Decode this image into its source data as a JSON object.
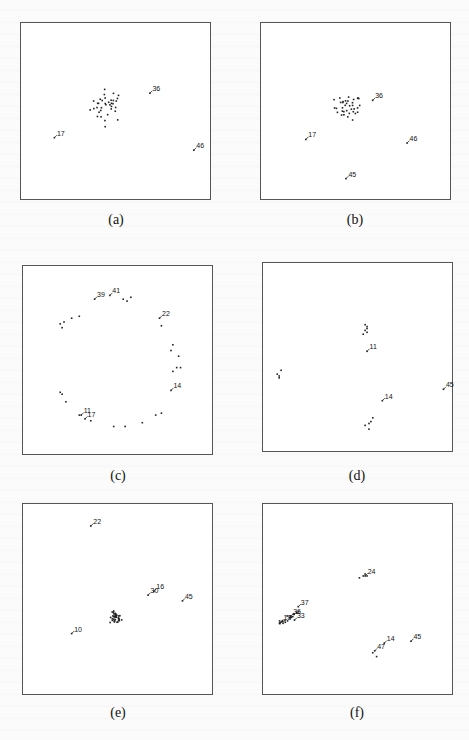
{
  "chart_data": [
    {
      "type": "scatter",
      "caption": "(a)",
      "title": "",
      "xlabel": "",
      "ylabel": "",
      "xlim": [
        0,
        1
      ],
      "ylim": [
        0,
        1
      ],
      "grid": false,
      "cluster": {
        "cx": 0.46,
        "cy": 0.53,
        "spread": 0.045,
        "n": 36
      },
      "labeled_points": [
        {
          "label": "36",
          "x": 0.68,
          "y": 0.6
        },
        {
          "label": "17",
          "x": 0.18,
          "y": 0.35
        },
        {
          "label": "46",
          "x": 0.91,
          "y": 0.28
        }
      ]
    },
    {
      "type": "scatter",
      "caption": "(b)",
      "title": "",
      "xlabel": "",
      "ylabel": "",
      "xlim": [
        0,
        1
      ],
      "ylim": [
        0,
        1
      ],
      "grid": false,
      "cluster": {
        "cx": 0.46,
        "cy": 0.52,
        "spread": 0.035,
        "n": 36
      },
      "labeled_points": [
        {
          "label": "36",
          "x": 0.59,
          "y": 0.56
        },
        {
          "label": "17",
          "x": 0.24,
          "y": 0.34
        },
        {
          "label": "46",
          "x": 0.77,
          "y": 0.32
        },
        {
          "label": "45",
          "x": 0.45,
          "y": 0.12
        }
      ]
    },
    {
      "type": "scatter",
      "caption": "(c)",
      "title": "",
      "xlabel": "",
      "ylabel": "",
      "xlim": [
        0,
        1
      ],
      "ylim": [
        0,
        1
      ],
      "grid": false,
      "unlabeled_points": [
        [
          0.53,
          0.82
        ],
        [
          0.55,
          0.81
        ],
        [
          0.57,
          0.83
        ],
        [
          0.3,
          0.73
        ],
        [
          0.26,
          0.72
        ],
        [
          0.22,
          0.7
        ],
        [
          0.2,
          0.69
        ],
        [
          0.21,
          0.67
        ],
        [
          0.73,
          0.68
        ],
        [
          0.79,
          0.58
        ],
        [
          0.78,
          0.55
        ],
        [
          0.82,
          0.52
        ],
        [
          0.81,
          0.46
        ],
        [
          0.83,
          0.46
        ],
        [
          0.79,
          0.44
        ],
        [
          0.21,
          0.32
        ],
        [
          0.23,
          0.28
        ],
        [
          0.3,
          0.21
        ],
        [
          0.36,
          0.18
        ],
        [
          0.48,
          0.15
        ],
        [
          0.54,
          0.15
        ],
        [
          0.63,
          0.17
        ],
        [
          0.73,
          0.22
        ],
        [
          0.7,
          0.21
        ],
        [
          0.2,
          0.33
        ]
      ],
      "labeled_points": [
        {
          "label": "39",
          "x": 0.38,
          "y": 0.82
        },
        {
          "label": "41",
          "x": 0.46,
          "y": 0.84
        },
        {
          "label": "22",
          "x": 0.72,
          "y": 0.72
        },
        {
          "label": "14",
          "x": 0.78,
          "y": 0.34
        },
        {
          "label": "11",
          "x": 0.31,
          "y": 0.21
        },
        {
          "label": "17",
          "x": 0.33,
          "y": 0.19
        }
      ]
    },
    {
      "type": "scatter",
      "caption": "(d)",
      "title": "",
      "xlabel": "",
      "ylabel": "",
      "xlim": [
        0,
        1
      ],
      "ylim": [
        0,
        1
      ],
      "grid": false,
      "unlabeled_points": [
        [
          0.54,
          0.64
        ],
        [
          0.55,
          0.65
        ],
        [
          0.54,
          0.67
        ],
        [
          0.55,
          0.66
        ],
        [
          0.53,
          0.62
        ],
        [
          0.55,
          0.63
        ],
        [
          0.08,
          0.41
        ],
        [
          0.09,
          0.39
        ],
        [
          0.1,
          0.43
        ],
        [
          0.09,
          0.4
        ],
        [
          0.56,
          0.15
        ],
        [
          0.57,
          0.16
        ],
        [
          0.54,
          0.14
        ],
        [
          0.56,
          0.12
        ],
        [
          0.58,
          0.18
        ]
      ],
      "labeled_points": [
        {
          "label": "11",
          "x": 0.55,
          "y": 0.53
        },
        {
          "label": "45",
          "x": 0.95,
          "y": 0.33
        },
        {
          "label": "14",
          "x": 0.63,
          "y": 0.27
        }
      ]
    },
    {
      "type": "scatter",
      "caption": "(e)",
      "title": "",
      "xlabel": "",
      "ylabel": "",
      "xlim": [
        0,
        1
      ],
      "ylim": [
        0,
        1
      ],
      "grid": false,
      "cluster": {
        "cx": 0.49,
        "cy": 0.4,
        "spread": 0.015,
        "n": 36
      },
      "labeled_points": [
        {
          "label": "22",
          "x": 0.36,
          "y": 0.88
        },
        {
          "label": "16",
          "x": 0.69,
          "y": 0.54
        },
        {
          "label": "30",
          "x": 0.66,
          "y": 0.52
        },
        {
          "label": "45",
          "x": 0.84,
          "y": 0.49
        },
        {
          "label": "10",
          "x": 0.26,
          "y": 0.32
        }
      ]
    },
    {
      "type": "scatter",
      "caption": "(f)",
      "title": "",
      "xlabel": "",
      "ylabel": "",
      "xlim": [
        0,
        1
      ],
      "ylim": [
        0,
        1
      ],
      "grid": false,
      "elongated_cluster": {
        "x0": 0.09,
        "y0": 0.37,
        "x1": 0.19,
        "y1": 0.43,
        "n": 22
      },
      "unlabeled_points": [
        [
          0.51,
          0.61
        ],
        [
          0.53,
          0.62
        ],
        [
          0.54,
          0.63
        ],
        [
          0.55,
          0.62
        ],
        [
          0.58,
          0.22
        ],
        [
          0.6,
          0.2
        ]
      ],
      "labeled_points": [
        {
          "label": "24",
          "x": 0.54,
          "y": 0.62
        },
        {
          "label": "37",
          "x": 0.19,
          "y": 0.46
        },
        {
          "label": "18",
          "x": 0.1,
          "y": 0.38
        },
        {
          "label": "36",
          "x": 0.15,
          "y": 0.41
        },
        {
          "label": "33",
          "x": 0.17,
          "y": 0.39
        },
        {
          "label": "14",
          "x": 0.64,
          "y": 0.27
        },
        {
          "label": "47",
          "x": 0.59,
          "y": 0.23
        },
        {
          "label": "45",
          "x": 0.78,
          "y": 0.28
        }
      ]
    }
  ]
}
